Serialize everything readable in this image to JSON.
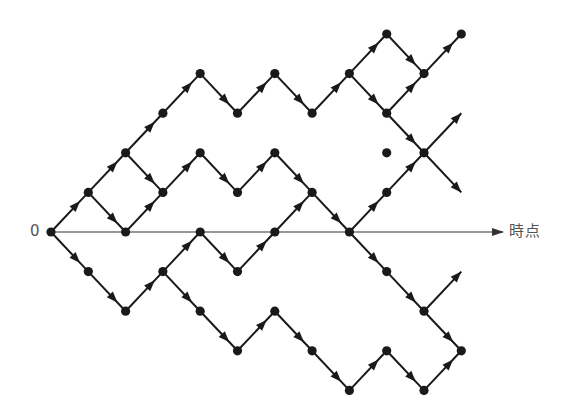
{
  "diagram": {
    "type": "binomial-lattice-paths",
    "origin_label": "0",
    "axis_label": "時点",
    "colors": {
      "edge": "#1a1a1a",
      "node": "#1a1a1a",
      "axis": "#333333",
      "label": "#555555"
    },
    "grid": {
      "x0": 51,
      "dx": 37.3,
      "y0": 232,
      "dy": 39.6
    },
    "axis": {
      "from_col": 0,
      "to_x": 503
    },
    "nodes": [
      [
        0,
        0
      ],
      [
        1,
        1
      ],
      [
        2,
        2
      ],
      [
        2,
        0
      ],
      [
        3,
        3
      ],
      [
        3,
        1
      ],
      [
        4,
        4
      ],
      [
        4,
        2
      ],
      [
        5,
        3
      ],
      [
        5,
        1
      ],
      [
        6,
        4
      ],
      [
        6,
        2
      ],
      [
        7,
        3
      ],
      [
        8,
        4
      ],
      [
        9,
        5
      ],
      [
        9,
        3
      ],
      [
        10,
        4
      ],
      [
        11,
        5
      ],
      [
        7,
        1
      ],
      [
        8,
        0
      ],
      [
        9,
        1
      ],
      [
        10,
        2
      ],
      [
        9,
        2
      ],
      [
        1,
        -1
      ],
      [
        2,
        -2
      ],
      [
        3,
        -1
      ],
      [
        4,
        0
      ],
      [
        5,
        -1
      ],
      [
        6,
        0
      ],
      [
        4,
        -2
      ],
      [
        5,
        -3
      ],
      [
        6,
        -2
      ],
      [
        7,
        -3
      ],
      [
        8,
        -4
      ],
      [
        9,
        -3
      ],
      [
        10,
        -4
      ],
      [
        11,
        -3
      ],
      [
        9,
        -1
      ],
      [
        10,
        -2
      ]
    ],
    "edges": [
      [
        [
          0,
          0
        ],
        [
          1,
          1
        ]
      ],
      [
        [
          1,
          1
        ],
        [
          2,
          2
        ]
      ],
      [
        [
          1,
          1
        ],
        [
          2,
          0
        ]
      ],
      [
        [
          2,
          2
        ],
        [
          3,
          3
        ]
      ],
      [
        [
          2,
          2
        ],
        [
          3,
          1
        ]
      ],
      [
        [
          2,
          0
        ],
        [
          3,
          1
        ]
      ],
      [
        [
          3,
          3
        ],
        [
          4,
          4
        ]
      ],
      [
        [
          4,
          4
        ],
        [
          5,
          3
        ]
      ],
      [
        [
          5,
          3
        ],
        [
          6,
          4
        ]
      ],
      [
        [
          6,
          4
        ],
        [
          7,
          3
        ]
      ],
      [
        [
          7,
          3
        ],
        [
          8,
          4
        ]
      ],
      [
        [
          8,
          4
        ],
        [
          9,
          5
        ]
      ],
      [
        [
          8,
          4
        ],
        [
          9,
          3
        ]
      ],
      [
        [
          9,
          5
        ],
        [
          10,
          4
        ]
      ],
      [
        [
          9,
          3
        ],
        [
          10,
          4
        ]
      ],
      [
        [
          10,
          4
        ],
        [
          11,
          5
        ]
      ],
      [
        [
          3,
          1
        ],
        [
          4,
          2
        ]
      ],
      [
        [
          4,
          2
        ],
        [
          5,
          1
        ]
      ],
      [
        [
          5,
          1
        ],
        [
          6,
          2
        ]
      ],
      [
        [
          6,
          2
        ],
        [
          7,
          1
        ]
      ],
      [
        [
          7,
          1
        ],
        [
          8,
          0
        ]
      ],
      [
        [
          9,
          3
        ],
        [
          10,
          2
        ]
      ],
      [
        [
          10,
          2
        ],
        [
          11,
          3
        ]
      ],
      [
        [
          10,
          2
        ],
        [
          11,
          1
        ]
      ],
      [
        [
          8,
          0
        ],
        [
          9,
          1
        ]
      ],
      [
        [
          9,
          1
        ],
        [
          10,
          2
        ]
      ],
      [
        [
          0,
          0
        ],
        [
          1,
          -1
        ]
      ],
      [
        [
          1,
          -1
        ],
        [
          2,
          -2
        ]
      ],
      [
        [
          2,
          -2
        ],
        [
          3,
          -1
        ]
      ],
      [
        [
          3,
          -1
        ],
        [
          4,
          0
        ]
      ],
      [
        [
          4,
          0
        ],
        [
          5,
          -1
        ]
      ],
      [
        [
          5,
          -1
        ],
        [
          6,
          0
        ]
      ],
      [
        [
          6,
          0
        ],
        [
          7,
          1
        ]
      ],
      [
        [
          3,
          -1
        ],
        [
          4,
          -2
        ]
      ],
      [
        [
          4,
          -2
        ],
        [
          5,
          -3
        ]
      ],
      [
        [
          5,
          -3
        ],
        [
          6,
          -2
        ]
      ],
      [
        [
          6,
          -2
        ],
        [
          7,
          -3
        ]
      ],
      [
        [
          7,
          -3
        ],
        [
          8,
          -4
        ]
      ],
      [
        [
          8,
          -4
        ],
        [
          9,
          -3
        ]
      ],
      [
        [
          9,
          -3
        ],
        [
          10,
          -4
        ]
      ],
      [
        [
          10,
          -4
        ],
        [
          11,
          -3
        ]
      ],
      [
        [
          8,
          0
        ],
        [
          9,
          -1
        ]
      ],
      [
        [
          9,
          -1
        ],
        [
          10,
          -2
        ]
      ],
      [
        [
          10,
          -2
        ],
        [
          11,
          -1
        ]
      ],
      [
        [
          10,
          -2
        ],
        [
          11,
          -3
        ]
      ]
    ],
    "open_arrow_tips": [
      [
        11,
        3
      ],
      [
        11,
        1
      ],
      [
        11,
        -1
      ]
    ]
  }
}
